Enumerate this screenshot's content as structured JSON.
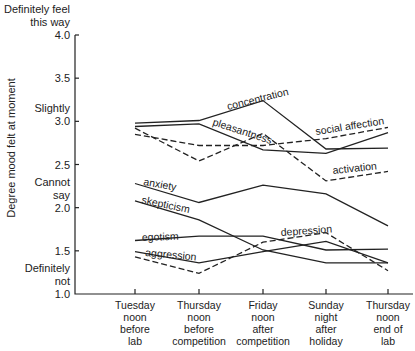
{
  "chart_data": {
    "type": "line",
    "title": "",
    "xlabel": "",
    "ylabel": "Degree mood felt at moment",
    "ylim": [
      1.0,
      4.0
    ],
    "yticks": [
      1.0,
      1.5,
      2.0,
      2.5,
      3.0,
      3.5,
      4.0
    ],
    "ytick_labels": [
      "1.0",
      "1.5",
      "2.0",
      "2.5",
      "3.0",
      "3.5",
      "4.0"
    ],
    "y_annotations": [
      {
        "value": 4.0,
        "lines": [
          "Definitely feel",
          "this way"
        ]
      },
      {
        "value": 3.0,
        "lines": [
          "Slightly"
        ]
      },
      {
        "value": 2.0,
        "lines": [
          "Cannot",
          "say"
        ]
      },
      {
        "value": 1.0,
        "lines": [
          "Definitely",
          "not"
        ]
      }
    ],
    "categories": [
      [
        "Tuesday",
        "noon",
        "before",
        "lab"
      ],
      [
        "Thursday",
        "noon",
        "before",
        "competition"
      ],
      [
        "Friday",
        "noon",
        "after",
        "competition"
      ],
      [
        "Sunday",
        "night",
        "after",
        "holiday"
      ],
      [
        "Thursday",
        "noon",
        "end of",
        "lab"
      ]
    ],
    "grid": false,
    "legend": "inline labels",
    "series": [
      {
        "name": "concentration",
        "style": "solid",
        "values": [
          2.98,
          3.01,
          3.24,
          2.68,
          2.69
        ]
      },
      {
        "name": "pleasantness",
        "style": "solid",
        "values": [
          2.94,
          2.97,
          2.67,
          2.63,
          2.87
        ]
      },
      {
        "name": "social affection",
        "style": "dashed",
        "values": [
          2.85,
          2.72,
          2.72,
          2.8,
          2.93
        ]
      },
      {
        "name": "activation",
        "style": "dashed",
        "values": [
          2.92,
          2.54,
          2.86,
          2.31,
          2.42
        ]
      },
      {
        "name": "anxiety",
        "style": "solid",
        "values": [
          2.28,
          2.06,
          2.26,
          2.16,
          1.79
        ]
      },
      {
        "name": "skepticism",
        "style": "solid",
        "values": [
          2.08,
          1.86,
          1.51,
          1.36,
          1.36
        ]
      },
      {
        "name": "egotism",
        "style": "solid",
        "values": [
          1.62,
          1.67,
          1.67,
          1.51,
          1.52
        ]
      },
      {
        "name": "aggression",
        "style": "solid",
        "values": [
          1.49,
          1.36,
          1.49,
          1.61,
          1.36
        ]
      },
      {
        "name": "depression",
        "style": "dashed",
        "values": [
          1.43,
          1.24,
          1.6,
          1.71,
          1.27
        ]
      }
    ],
    "series_labels": [
      {
        "name": "concentration",
        "x": 228,
        "y": 110,
        "rotate": -14
      },
      {
        "name": "pleasantness",
        "x": 212,
        "y": 125,
        "rotate": 18
      },
      {
        "name": "social affection",
        "x": 316,
        "y": 135,
        "rotate": -9
      },
      {
        "name": "activation",
        "x": 333,
        "y": 174,
        "rotate": -6
      },
      {
        "name": "anxiety",
        "x": 143,
        "y": 185,
        "rotate": 10
      },
      {
        "name": "skepticism",
        "x": 141,
        "y": 203,
        "rotate": 12
      },
      {
        "name": "egotism",
        "x": 142,
        "y": 241,
        "rotate": -2
      },
      {
        "name": "aggression",
        "x": 145,
        "y": 256,
        "rotate": 5
      },
      {
        "name": "depression",
        "x": 281,
        "y": 236,
        "rotate": -4
      }
    ]
  }
}
